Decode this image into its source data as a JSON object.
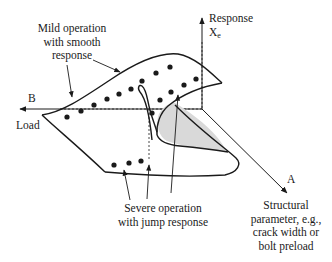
{
  "diagram": {
    "type": "cusp-catastrophe-surface",
    "axes": {
      "response": {
        "label": "Response",
        "symbol": "X",
        "subscript": "e"
      },
      "load": {
        "label": "Load",
        "axis_letter": "B"
      },
      "structural": {
        "axis_letter": "A",
        "line1": "Structural",
        "line2": "parameter, e.g.,",
        "line3": "crack width or",
        "line4": "bolt preload"
      }
    },
    "annotations": {
      "mild": {
        "line1": "Mild operation",
        "line2": "with smooth",
        "line3": "response"
      },
      "severe": {
        "line1": "Severe operation",
        "line2": "with jump response"
      }
    },
    "colors": {
      "stroke": "#1a1a1a",
      "fold_fill": "#d9d9d9",
      "background": "#ffffff"
    }
  }
}
